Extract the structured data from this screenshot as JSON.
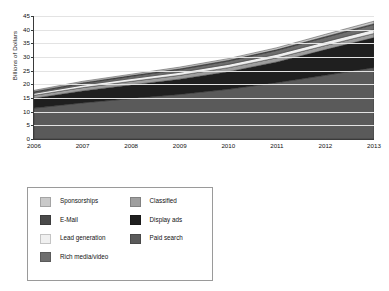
{
  "chart_data": {
    "type": "area",
    "stacked": true,
    "title": "",
    "subtitle": "",
    "xlabel": "",
    "ylabel": "Billions of Dollars",
    "x": [
      2006,
      2007,
      2008,
      2009,
      2010,
      2011,
      2012,
      2013
    ],
    "xtick_labels": [
      "2006",
      "2007",
      "2008",
      "2009",
      "2010",
      "2011",
      "2012",
      "2013"
    ],
    "ytick_labels": [
      "0",
      "5",
      "10",
      "15",
      "20",
      "25",
      "30",
      "35",
      "40",
      "45"
    ],
    "yticks": [
      0,
      5,
      10,
      15,
      20,
      25,
      30,
      35,
      40,
      45
    ],
    "ylim": [
      0,
      45
    ],
    "xlim": [
      2006,
      2013
    ],
    "grid": true,
    "legend_position": "below",
    "stack_order_bottom_to_top": [
      "Paid search",
      "Display ads",
      "Classified",
      "Lead generation",
      "Rich media/video",
      "E-Mail",
      "Sponsorships"
    ],
    "series": [
      {
        "name": "Paid search",
        "color": "#5a5a5a",
        "values": [
          11.3,
          13.2,
          14.8,
          16.3,
          18.2,
          20.6,
          23.3,
          26.1
        ]
      },
      {
        "name": "Display ads",
        "color": "#1f1f1f",
        "values": [
          3.6,
          4.4,
          5.0,
          5.6,
          6.4,
          7.6,
          9.4,
          11.0
        ]
      },
      {
        "name": "Classified",
        "color": "#9e9e9e",
        "values": [
          1.1,
          1.2,
          1.3,
          1.4,
          1.5,
          1.5,
          1.5,
          1.5
        ]
      },
      {
        "name": "Lead generation",
        "color": "#f0f0f0",
        "values": [
          0.7,
          0.9,
          1.0,
          1.1,
          1.2,
          1.3,
          1.4,
          1.5
        ]
      },
      {
        "name": "Rich media/video",
        "color": "#6e6e6e",
        "values": [
          0.4,
          0.6,
          0.8,
          1.0,
          1.2,
          1.4,
          1.6,
          1.8
        ]
      },
      {
        "name": "E-Mail",
        "color": "#4a4a4a",
        "values": [
          0.3,
          0.3,
          0.3,
          0.3,
          0.3,
          0.3,
          0.3,
          0.3
        ]
      },
      {
        "name": "Sponsorships",
        "color": "#c9c9c9",
        "values": [
          0.4,
          0.5,
          0.5,
          0.6,
          0.6,
          0.7,
          0.8,
          0.9
        ]
      }
    ],
    "totals": [
      17.8,
      21.1,
      23.7,
      26.3,
      29.4,
      33.4,
      38.3,
      43.1
    ]
  },
  "axis": {
    "y_title": "Billions of Dollars"
  },
  "legend": {
    "column_left": [
      {
        "label": "Sponsorships",
        "color": "#c9c9c9"
      },
      {
        "label": "E-Mail",
        "color": "#4a4a4a"
      },
      {
        "label": "Lead generation",
        "color": "#f0f0f0"
      },
      {
        "label": "Rich media/video",
        "color": "#6e6e6e"
      }
    ],
    "column_right": [
      {
        "label": "Classified",
        "color": "#9e9e9e"
      },
      {
        "label": "Display ads",
        "color": "#1f1f1f"
      },
      {
        "label": "Paid search",
        "color": "#5a5a5a"
      }
    ]
  }
}
